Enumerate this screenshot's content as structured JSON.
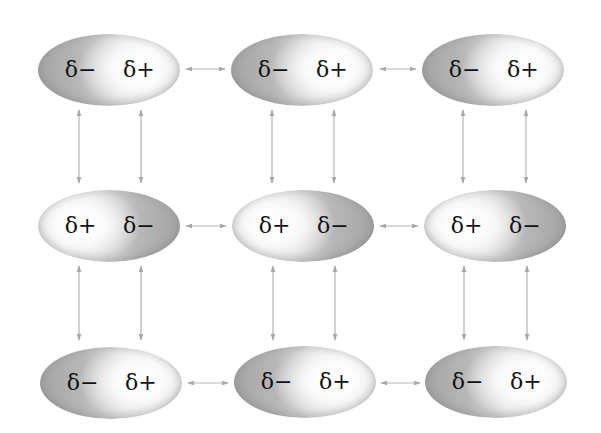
{
  "diagram": {
    "title": "",
    "colors": {
      "arrow": "#b0b0b0",
      "molecule_dark": "#a4a4a4",
      "molecule_light": "#f5f5f5",
      "text": "#111111"
    },
    "rows": [
      {
        "molecules": [
          {
            "left_label": "δ−",
            "right_label": "δ+",
            "orientation": "neg-left"
          },
          {
            "left_label": "δ−",
            "right_label": "δ+",
            "orientation": "neg-left"
          },
          {
            "left_label": "δ−",
            "right_label": "δ+",
            "orientation": "neg-left"
          }
        ]
      },
      {
        "molecules": [
          {
            "left_label": "δ+",
            "right_label": "δ−",
            "orientation": "pos-left"
          },
          {
            "left_label": "δ+",
            "right_label": "δ−",
            "orientation": "pos-left"
          },
          {
            "left_label": "δ+",
            "right_label": "δ−",
            "orientation": "pos-left"
          }
        ]
      },
      {
        "molecules": [
          {
            "left_label": "δ−",
            "right_label": "δ+",
            "orientation": "neg-left"
          },
          {
            "left_label": "δ−",
            "right_label": "δ+",
            "orientation": "neg-left"
          },
          {
            "left_label": "δ−",
            "right_label": "δ+",
            "orientation": "neg-left"
          }
        ]
      }
    ],
    "interactions": {
      "horizontal_arrows_per_row": 2,
      "vertical_arrows_per_gap": 6,
      "arrow_style": "double-headed"
    }
  }
}
